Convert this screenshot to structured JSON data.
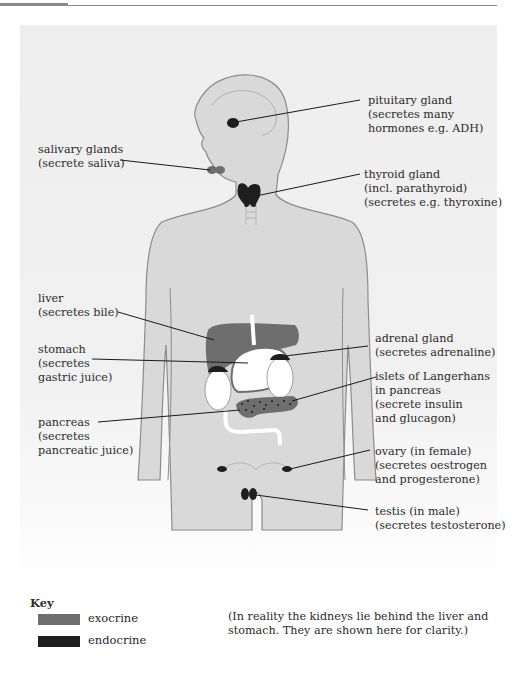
{
  "figure": {
    "colors": {
      "body_fill": "#d9d9d9",
      "body_outline": "#8c8c8c",
      "exocrine": "#6e6e6e",
      "endocrine": "#1e1e1e",
      "kidney": "#ffffff",
      "leader_line": "#1a1a1a"
    },
    "labels": {
      "pituitary": {
        "line1": "pituitary gland",
        "line2": "(secretes many",
        "line3": "hormones e.g. ADH)"
      },
      "salivary": {
        "line1": "salivary glands",
        "line2": "(secrete saliva)"
      },
      "thyroid": {
        "line1": "thyroid gland",
        "line2": "(incl. parathyroid)",
        "line3": "(secretes e.g. thyroxine)"
      },
      "liver": {
        "line1": "liver",
        "line2": "(secretes bile)"
      },
      "stomach": {
        "line1": "stomach",
        "line2": "(secretes",
        "line3": "gastric juice)"
      },
      "adrenal": {
        "line1": "adrenal gland",
        "line2": "(secretes adrenaline)"
      },
      "islets": {
        "line1": "islets of Langerhans",
        "line2": "in pancreas",
        "line3": "(secrete insulin",
        "line4": "and glucagon)"
      },
      "pancreas": {
        "line1": "pancreas",
        "line2": "(secretes",
        "line3": "pancreatic juice)"
      },
      "ovary": {
        "line1": "ovary (in female)",
        "line2": "(secretes oestrogen",
        "line3": "and progesterone)"
      },
      "testis": {
        "line1": "testis (in male)",
        "line2": "(secretes testosterone)"
      }
    }
  },
  "key": {
    "title": "Key",
    "items": [
      {
        "label": "exocrine",
        "color": "#6e6e6e"
      },
      {
        "label": "endocrine",
        "color": "#1e1e1e"
      }
    ]
  },
  "note": {
    "line1": "(In reality the kidneys lie behind the liver and",
    "line2": "stomach. They are shown here for clarity.)"
  }
}
